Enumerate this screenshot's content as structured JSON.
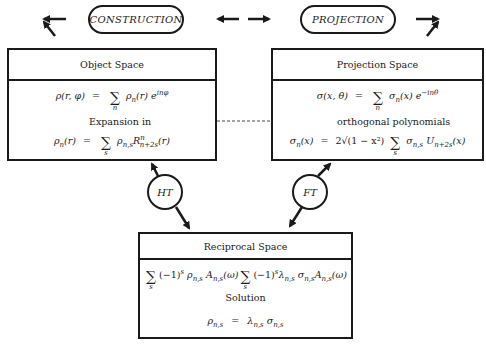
{
  "top": {
    "construction_label": "CONSTRUCTION",
    "projection_label": "PROJECTION"
  },
  "object_space": {
    "title": "Object Space",
    "eq1": {
      "lhs": "ρ(r, φ)",
      "eq": "=",
      "sum_index": "n",
      "rhs": "ρ",
      "rhs_sub": "n",
      "rhs_arg": "(r) e",
      "rhs_exp": "inφ"
    },
    "expansion_label": "Expansion in",
    "eq2": {
      "lhs": "ρ",
      "lhs_sub": "n",
      "lhs_arg": "(r)",
      "eq": "=",
      "sum_index": "s",
      "rhs1": "ρ",
      "rhs1_sub": "n,s",
      "rhs2": "R",
      "rhs2_sup": "n",
      "rhs2_sub": "n+2s",
      "rhs2_arg": "(r)"
    }
  },
  "projection_space": {
    "title": "Projection Space",
    "eq1": {
      "lhs": "σ(x, θ)",
      "eq": "=",
      "sum_index": "n",
      "rhs": "σ",
      "rhs_sub": "n",
      "rhs_arg": "(x) e",
      "rhs_exp": "−inθ"
    },
    "polynomials_label": "orthogonal polynomials",
    "eq2": {
      "lhs": "σ",
      "lhs_sub": "n",
      "lhs_arg": "(x)",
      "eq": "=",
      "coef": "2√(1 − x²)",
      "sum_index": "s",
      "rhs1": "σ",
      "rhs1_sub": "n,s",
      "rhs2": "U",
      "rhs2_sub": "n+2s",
      "rhs2_arg": "(x)"
    }
  },
  "transforms": {
    "ht_label": "HT",
    "ft_label": "FT"
  },
  "reciprocal_space": {
    "title": "Reciprocal Space",
    "left_expr": {
      "sum_index": "s",
      "body": "(−1)",
      "body_sup": "s",
      "t1": "ρ",
      "t1_sub": "n,s",
      "t2": "A",
      "t2_sub": "n,s",
      "t2_arg": "(ω)"
    },
    "right_expr": {
      "sum_index": "s",
      "body": "(−1)",
      "body_sup": "s",
      "t1": "λ",
      "t1_sub": "n,s",
      "t2": "σ",
      "t2_sub": "n,s",
      "t3": "A",
      "t3_sub": "n,s",
      "t3_arg": "(ω)"
    },
    "solution_label": "Solution",
    "solution_eq": {
      "lhs": "ρ",
      "lhs_sub": "n,s",
      "eq": "=",
      "r1": "λ",
      "r1_sub": "n,s",
      "r2": "σ",
      "r2_sub": "n,s"
    }
  },
  "colors": {
    "ink": "#1a1a1a",
    "background": "#ffffff"
  }
}
